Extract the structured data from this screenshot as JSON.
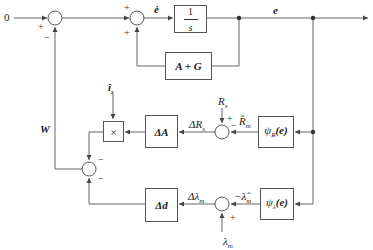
{
  "diagram": {
    "type": "control block diagram",
    "input": {
      "label": "0"
    },
    "signals": {
      "e_dot": "ė",
      "e": "e",
      "W": "W",
      "i_hat": "î",
      "i_sub": "s",
      "R_s": "R",
      "R_s_sub": "s",
      "R_hat": "R̂",
      "R_hat_sub": "m",
      "delta_R": "ΔR",
      "delta_R_sub": "s",
      "delta_lambda": "Δλ",
      "delta_lambda_sub": "m",
      "neg_lambda_hat": "−λ̂",
      "neg_lambda_hat_sub": "m",
      "lambda_m": "λ",
      "lambda_m_sub": "m"
    },
    "blocks": {
      "integrator_num": "1",
      "integrator_den": "s",
      "feedback": "A + G",
      "multiplier": "×",
      "delta_A": "ΔA",
      "delta_d": "Δd",
      "psi_R": "ψ",
      "psi_R_sub": "R",
      "psi_R_arg": "(e)",
      "psi_lambda": "ψ",
      "psi_lambda_sub": "λ",
      "psi_lambda_arg": "(e)"
    },
    "signs": {
      "j1_in": "+",
      "j1_fb": "−",
      "j2_in": "+",
      "j2_fb": "+",
      "jR_top": "+",
      "jR_right": "−",
      "j3_top": "−",
      "j3_bottom": "−",
      "jL_bottom": "+"
    }
  }
}
